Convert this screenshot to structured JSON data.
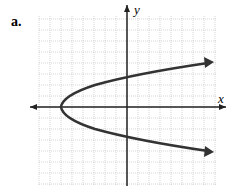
{
  "label": "a.",
  "axes": {
    "x_label": "x",
    "y_label": "y"
  },
  "graph": {
    "type": "sideways parabola opening right",
    "vertex": [
      -6,
      0
    ],
    "y_intercepts": [
      2.6,
      -2.6
    ],
    "grid": true
  }
}
